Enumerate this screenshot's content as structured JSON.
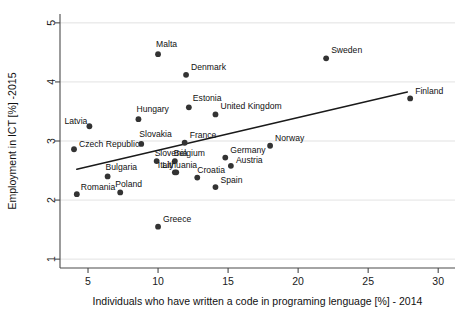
{
  "chart_data": {
    "type": "scatter",
    "title": "",
    "xlabel": "Individuals who have written a code in programing lenguage [%] - 2014",
    "ylabel": "Employment in ICT [%] -2015",
    "xlim": [
      3.0,
      31.2
    ],
    "ylim": [
      0.85,
      5.15
    ],
    "xticks": [
      5,
      10,
      15,
      20,
      25,
      30
    ],
    "xtick_labels": [
      "5",
      "10",
      "15",
      "20",
      "25",
      "30"
    ],
    "yticks": [
      1,
      2,
      3,
      4,
      5
    ],
    "ytick_labels": [
      "1",
      "2",
      "3",
      "4",
      "5"
    ],
    "grid": "horizontal",
    "legend": "none",
    "point_color": "#333333",
    "line_color": "#1a1a1a",
    "points": [
      {
        "label": "Malta",
        "x": 10.0,
        "y": 4.47,
        "lx": -2,
        "ly": -7,
        "anchor": "start"
      },
      {
        "label": "Denmark",
        "x": 12.0,
        "y": 4.12,
        "lx": 5,
        "ly": -5,
        "anchor": "start"
      },
      {
        "label": "Sweden",
        "x": 22.0,
        "y": 4.4,
        "lx": 5,
        "ly": -5,
        "anchor": "start"
      },
      {
        "label": "Estonia",
        "x": 12.2,
        "y": 3.57,
        "lx": 4,
        "ly": -6,
        "anchor": "start"
      },
      {
        "label": "United Kingdom",
        "x": 14.1,
        "y": 3.45,
        "lx": 5,
        "ly": -5,
        "anchor": "start"
      },
      {
        "label": "Finland",
        "x": 28.0,
        "y": 3.72,
        "lx": 5,
        "ly": -4,
        "anchor": "start"
      },
      {
        "label": "Hungary",
        "x": 8.6,
        "y": 3.37,
        "lx": -2,
        "ly": -7,
        "anchor": "start"
      },
      {
        "label": "Latvia",
        "x": 5.1,
        "y": 3.25,
        "lx": -25,
        "ly": -2,
        "anchor": "start"
      },
      {
        "label": "France",
        "x": 11.9,
        "y": 2.97,
        "lx": 5,
        "ly": -5,
        "anchor": "start"
      },
      {
        "label": "Slovakia",
        "x": 8.8,
        "y": 2.95,
        "lx": -2,
        "ly": -7,
        "anchor": "start"
      },
      {
        "label": "Czech Republic",
        "x": 4.0,
        "y": 2.86,
        "lx": 5,
        "ly": -2,
        "anchor": "start"
      },
      {
        "label": "Norway",
        "x": 18.0,
        "y": 2.92,
        "lx": 5,
        "ly": -5,
        "anchor": "start"
      },
      {
        "label": "Germany",
        "x": 14.8,
        "y": 2.72,
        "lx": 5,
        "ly": -5,
        "anchor": "start"
      },
      {
        "label": "Slovenia",
        "x": 9.9,
        "y": 2.66,
        "lx": -2,
        "ly": -5,
        "anchor": "start"
      },
      {
        "label": "Belgium",
        "x": 11.2,
        "y": 2.66,
        "lx": -1,
        "ly": -5,
        "anchor": "start"
      },
      {
        "label": "Austria",
        "x": 15.2,
        "y": 2.58,
        "lx": 5,
        "ly": -3,
        "anchor": "start"
      },
      {
        "label": "Italy",
        "x": 11.2,
        "y": 2.47,
        "lx": -17,
        "ly": -4,
        "anchor": "start"
      },
      {
        "label": "Lithuania",
        "x": 11.3,
        "y": 2.47,
        "lx": -14,
        "ly": -4,
        "anchor": "start"
      },
      {
        "label": "Croatia",
        "x": 12.8,
        "y": 2.38,
        "lx": 0,
        "ly": -5,
        "anchor": "start"
      },
      {
        "label": "Bulgaria",
        "x": 6.4,
        "y": 2.4,
        "lx": -2,
        "ly": -6,
        "anchor": "start"
      },
      {
        "label": "Spain",
        "x": 14.1,
        "y": 2.22,
        "lx": 5,
        "ly": -4,
        "anchor": "start"
      },
      {
        "label": "Poland",
        "x": 7.3,
        "y": 2.13,
        "lx": -5,
        "ly": -5,
        "anchor": "start"
      },
      {
        "label": "Romania",
        "x": 4.2,
        "y": 2.1,
        "lx": 4,
        "ly": -4,
        "anchor": "start"
      },
      {
        "label": "Greece",
        "x": 10.0,
        "y": 1.55,
        "lx": 5,
        "ly": -5,
        "anchor": "start"
      }
    ],
    "trendline": {
      "x0": 4.2,
      "y0": 2.52,
      "x1": 27.8,
      "y1": 3.83
    }
  }
}
